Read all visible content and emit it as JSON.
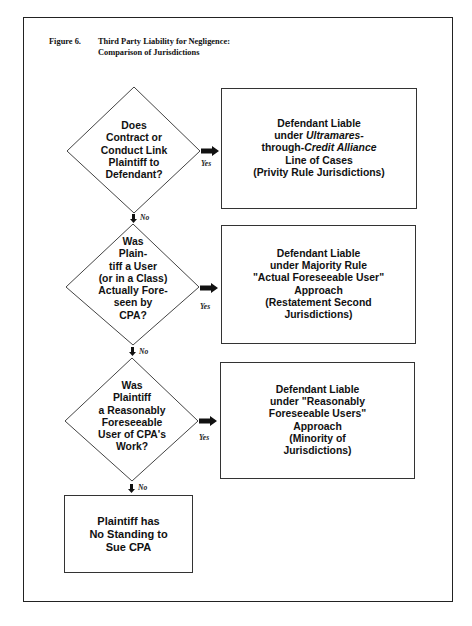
{
  "figure": {
    "number": "Figure 6.",
    "title_line1": "Third Party Liability for Negligence:",
    "title_line2": "Comparison of Jurisdictions"
  },
  "flowchart": {
    "decisions": [
      {
        "lines": [
          "Does",
          "Contract or",
          "Conduct Link",
          "Plaintiff to",
          "Defendant?"
        ]
      },
      {
        "lines": [
          "Was",
          "Plain-",
          "tiff a User",
          "(or in a Class)",
          "Actually Fore-",
          "seen by",
          "CPA?"
        ]
      },
      {
        "lines": [
          "Was",
          "Plaintiff",
          "a Reasonably",
          "Foreseeable",
          "User of CPA's",
          "Work?"
        ]
      }
    ],
    "outcomes": [
      {
        "l1": "Defendant Liable",
        "l2_pre": "under ",
        "l2_it": "Ultramares",
        "l2_post": "-",
        "l3_pre": "through-",
        "l3_it": "Credit Alliance",
        "l4": "Line of Cases",
        "l5": "(Privity Rule Jurisdictions)"
      },
      {
        "l1": "Defendant Liable",
        "l2": "under Majority Rule",
        "l3": "\"Actual Foreseeable User\"",
        "l4": "Approach",
        "l5": "(Restatement Second",
        "l6": "Jurisdictions)"
      },
      {
        "l1": "Defendant Liable",
        "l2": "under \"Reasonably",
        "l3": "Foreseeable Users\"",
        "l4": "Approach",
        "l5": "(Minority of",
        "l6": "Jurisdictions)"
      }
    ],
    "final": {
      "l1": "Plaintiff has",
      "l2": "No Standing to",
      "l3": "Sue CPA"
    },
    "labels": {
      "yes": "Yes",
      "no": "No"
    }
  },
  "colors": {
    "line": "#333333",
    "arrow": "#111111",
    "background": "#ffffff"
  }
}
